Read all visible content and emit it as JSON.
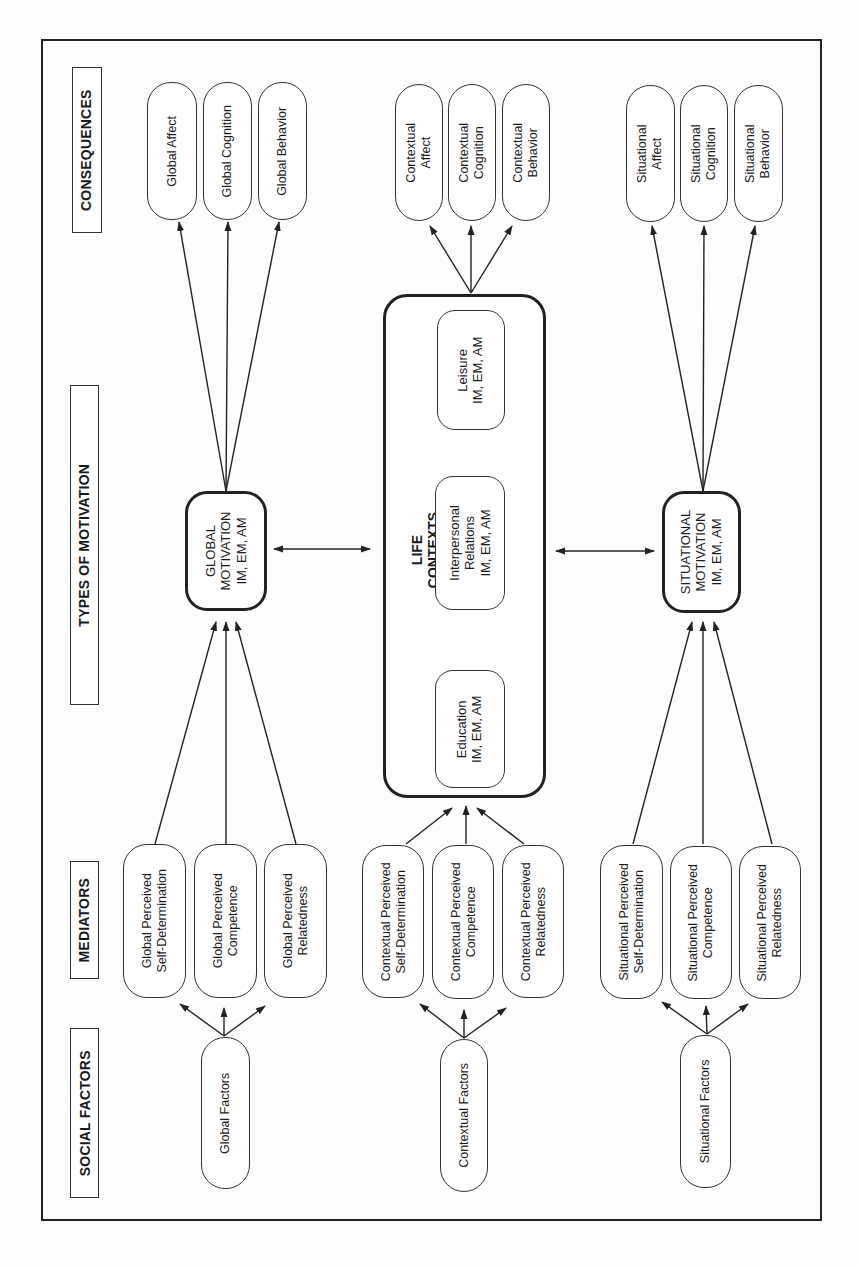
{
  "headers": {
    "consequences": "CONSEQUENCES",
    "types_of_motivation": "TYPES OF MOTIVATION",
    "mediators": "MEDIATORS",
    "social_factors": "SOCIAL FACTORS"
  },
  "global": {
    "consequences": [
      "Global Affect",
      "Global Cognition",
      "Global Behavior"
    ],
    "motivation": [
      "GLOBAL",
      "MOTIVATION",
      "IM, EM, AM"
    ],
    "mediators": [
      [
        "Global Perceived",
        "Self-Determination"
      ],
      [
        "Global Perceived",
        "Competence"
      ],
      [
        "Global Perceived",
        "Relatedness"
      ]
    ],
    "factors": "Global Factors"
  },
  "contextual": {
    "consequences": [
      [
        "Contextual",
        "Affect"
      ],
      [
        "Contextual",
        "Cognition"
      ],
      [
        "Contextual",
        "Behavior"
      ]
    ],
    "life_contexts": {
      "title": "LIFE CONTEXTS",
      "items": [
        [
          "Leisure",
          "IM, EM, AM"
        ],
        [
          "Interpersonal",
          "Relations",
          "IM, EM, AM"
        ],
        [
          "Education",
          "IM, EM, AM"
        ]
      ]
    },
    "mediators": [
      [
        "Contextual Perceived",
        "Self-Determination"
      ],
      [
        "Contextual Perceived",
        "Competence"
      ],
      [
        "Contextual Perceived",
        "Relatedness"
      ]
    ],
    "factors": "Contextual Factors"
  },
  "situational": {
    "consequences": [
      [
        "Situational",
        "Affect"
      ],
      [
        "Situational",
        "Cognition"
      ],
      [
        "Situational",
        "Behavior"
      ]
    ],
    "motivation": [
      "SITUATIONAL",
      "MOTIVATION",
      "IM, EM, AM"
    ],
    "mediators": [
      [
        "Situational Perceived",
        "Self-Determination"
      ],
      [
        "Situational Perceived",
        "Competence"
      ],
      [
        "Situational Perceived",
        "Relatedness"
      ]
    ],
    "factors": "Situational Factors"
  }
}
